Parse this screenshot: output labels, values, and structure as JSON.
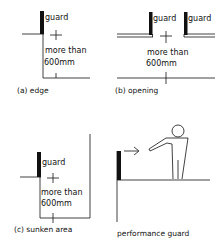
{
  "panels": {
    "a": {
      "guard_label": "guard",
      "dim_line1": "more than",
      "dim_line2": "600mm",
      "caption": "(a) edge"
    },
    "b": {
      "guard_label_left": "guard",
      "guard_label_right": "guard",
      "dim_line1": "more than",
      "dim_line2": "600mm",
      "caption": "(b) opening"
    },
    "c": {
      "guard_label": "guard",
      "dim_line1": "more than",
      "dim_line2": "600mm",
      "caption": "(c) sunken area"
    },
    "d": {
      "caption": "performance guard"
    }
  },
  "colors": {
    "ink": "#111111",
    "background": "#ffffff"
  }
}
